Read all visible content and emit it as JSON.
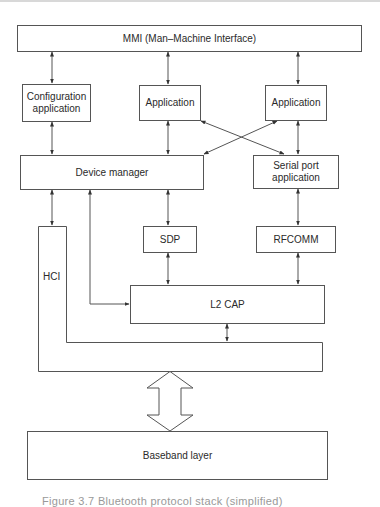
{
  "diagram": {
    "title": "Bluetooth protocol stack",
    "nodes": {
      "mmi": "MMI (Man–Machine Interface)",
      "config_app": "Configuration application",
      "config_app_line1": "Configuration",
      "config_app_line2": "application",
      "app1": "Application",
      "app2": "Application",
      "device_manager": "Device manager",
      "serial_port_line1": "Serial port",
      "serial_port_line2": "application",
      "sdp": "SDP",
      "rfcomm": "RFCOMM",
      "hci": "HCI",
      "l2cap": "L2 CAP",
      "baseband": "Baseband layer"
    },
    "edges": [
      {
        "from": "mmi",
        "to": "config_app",
        "type": "bidirectional"
      },
      {
        "from": "mmi",
        "to": "app1",
        "type": "bidirectional"
      },
      {
        "from": "mmi",
        "to": "app2",
        "type": "bidirectional"
      },
      {
        "from": "config_app",
        "to": "device_manager",
        "type": "bidirectional"
      },
      {
        "from": "app1",
        "to": "device_manager",
        "type": "bidirectional"
      },
      {
        "from": "app1",
        "to": "serial_port",
        "type": "bidirectional"
      },
      {
        "from": "app2",
        "to": "device_manager",
        "type": "bidirectional"
      },
      {
        "from": "app2",
        "to": "serial_port",
        "type": "bidirectional"
      },
      {
        "from": "device_manager",
        "to": "hci",
        "type": "bidirectional"
      },
      {
        "from": "device_manager",
        "to": "l2cap",
        "type": "bidirectional"
      },
      {
        "from": "device_manager",
        "to": "sdp",
        "type": "bidirectional"
      },
      {
        "from": "serial_port",
        "to": "rfcomm",
        "type": "bidirectional"
      },
      {
        "from": "sdp",
        "to": "l2cap",
        "type": "bidirectional"
      },
      {
        "from": "rfcomm",
        "to": "l2cap",
        "type": "bidirectional"
      },
      {
        "from": "l2cap",
        "to": "hci",
        "type": "bidirectional"
      },
      {
        "from": "hci",
        "to": "baseband",
        "type": "bidirectional-hollow"
      }
    ],
    "caption": "Figure 3.7  Bluetooth protocol stack (simplified)"
  },
  "colors": {
    "line": "#555555",
    "text": "#2a2a2a",
    "background": "#ffffff"
  }
}
